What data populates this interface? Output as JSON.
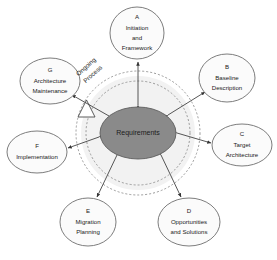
{
  "diagram": {
    "background_color": "#ffffff",
    "center": {
      "label": "Requirements",
      "fill_color": "#8a8a8a",
      "stroke_color": "#5d5d5d",
      "cx": 138,
      "cy": 133,
      "rx": 38,
      "ry": 26
    },
    "ring": {
      "process_label_line1": "Ongoing",
      "process_label_line2": "Process",
      "inner_radius": 52,
      "outer_radius": 62,
      "style": "dashed",
      "band_color": "#f2f2f2",
      "dash_color": "#9a9a9a",
      "arrow_direction": "clockwise"
    },
    "nodes": [
      {
        "id": "A",
        "letter": "A",
        "lines": [
          "Initiation",
          "and",
          "Framework"
        ],
        "cx": 137,
        "cy": 33,
        "rx": 27,
        "ry": 26,
        "angle_deg": -90
      },
      {
        "id": "B",
        "letter": "B",
        "lines": [
          "Baseline",
          "Description"
        ],
        "cx": 227,
        "cy": 78,
        "rx": 28,
        "ry": 24,
        "angle_deg": -30
      },
      {
        "id": "C",
        "letter": "C",
        "lines": [
          "Target",
          "Architecture"
        ],
        "cx": 242,
        "cy": 145,
        "rx": 30,
        "ry": 21,
        "angle_deg": 5
      },
      {
        "id": "D",
        "letter": "D",
        "lines": [
          "Opportunities",
          "and Solutions"
        ],
        "cx": 189,
        "cy": 222,
        "rx": 31,
        "ry": 24,
        "angle_deg": 62
      },
      {
        "id": "E",
        "letter": "E",
        "lines": [
          "Migration",
          "Planning"
        ],
        "cx": 88,
        "cy": 222,
        "rx": 28,
        "ry": 24,
        "angle_deg": 118
      },
      {
        "id": "F",
        "letter": "F",
        "lines": [
          "Implementation"
        ],
        "cx": 37,
        "cy": 152,
        "rx": 30,
        "ry": 21,
        "angle_deg": 172
      },
      {
        "id": "G",
        "letter": "G",
        "lines": [
          "Architecture",
          "Maintenance"
        ],
        "cx": 50,
        "cy": 81,
        "rx": 30,
        "ry": 23,
        "angle_deg": -145
      }
    ]
  }
}
